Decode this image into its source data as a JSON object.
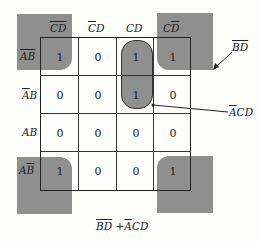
{
  "karnaugh_map": {
    "column_headers": [
      {
        "text": "CD",
        "bar": "both"
      },
      {
        "text": "CD",
        "bar": "C"
      },
      {
        "text": "CD",
        "bar": "none"
      },
      {
        "text": "CD",
        "bar": "D"
      }
    ],
    "row_headers": [
      {
        "text": "AB",
        "bar": "both"
      },
      {
        "text": "AB",
        "bar": "A"
      },
      {
        "text": "AB",
        "bar": "none"
      },
      {
        "text": "AB",
        "bar": "B"
      }
    ],
    "cells": [
      [
        "1",
        "0",
        "1",
        "1"
      ],
      [
        "0",
        "0",
        "1",
        "0"
      ],
      [
        "0",
        "0",
        "0",
        "0"
      ],
      [
        "1",
        "0",
        "0",
        "1"
      ]
    ],
    "groups": [
      {
        "name": "corner-group",
        "label": "BD",
        "label_bar": "both",
        "cells": "four corners"
      },
      {
        "name": "column-group",
        "label": "ACD",
        "label_bar": "A",
        "cells": "rows 1-2, column CD"
      }
    ],
    "expression": "BD + ACD"
  }
}
